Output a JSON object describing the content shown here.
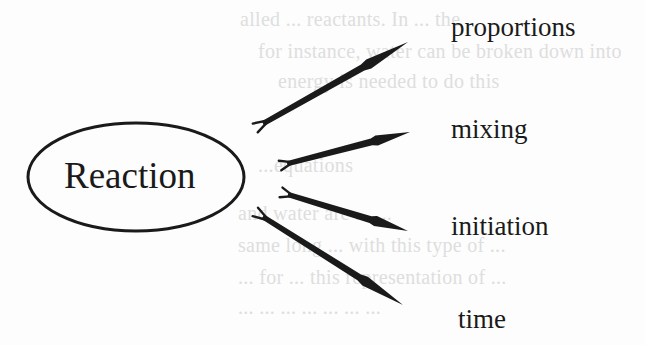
{
  "diagram": {
    "type": "hub-and-spoke",
    "center": {
      "label": "Reaction",
      "shape": "ellipse",
      "cx": 136,
      "cy": 177,
      "rx": 109,
      "ry": 55
    },
    "branches": [
      {
        "label": "proportions",
        "arrow": {
          "from": [
            257,
            127
          ],
          "to": [
            408,
            42
          ]
        },
        "label_pos": [
          451,
          14
        ]
      },
      {
        "label": "mixing",
        "arrow": {
          "from": [
            282,
            165
          ],
          "to": [
            410,
            132
          ]
        },
        "label_pos": [
          451,
          116
        ]
      },
      {
        "label": "initiation",
        "arrow": {
          "from": [
            283,
            193
          ],
          "to": [
            408,
            231
          ]
        },
        "label_pos": [
          451,
          213
        ]
      },
      {
        "label": "time",
        "arrow": {
          "from": [
            257,
            213
          ],
          "to": [
            403,
            305
          ]
        },
        "label_pos": [
          458,
          306
        ]
      }
    ],
    "colors": {
      "ink": "#1a1a1a",
      "background": "#fdfdfd",
      "show_through": "#d4d4d4"
    }
  },
  "show_through_text": [
    {
      "text": "alled ... reactants. In ... the",
      "x": 240,
      "y": 24
    },
    {
      "text": "for instance, water can be broken down into",
      "x": 258,
      "y": 55
    },
    {
      "text": "energy is needed to do this",
      "x": 278,
      "y": 86
    },
    {
      "text": "...equations",
      "x": 258,
      "y": 170
    },
    {
      "text": "and water are ... ...",
      "x": 238,
      "y": 218
    },
    {
      "text": "same long ... with this type of ...",
      "x": 238,
      "y": 250
    },
    {
      "text": "... for ... this representation of ...",
      "x": 238,
      "y": 282
    },
    {
      "text": "... ... ... ... ... ... ...",
      "x": 238,
      "y": 312
    }
  ]
}
